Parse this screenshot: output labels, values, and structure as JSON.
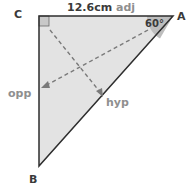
{
  "diagram": {
    "type": "right-triangle",
    "vertices": {
      "C": {
        "label": "C",
        "note": "right angle"
      },
      "A": {
        "label": "A"
      },
      "B": {
        "label": "B"
      }
    },
    "top_side": {
      "length": "12.6cm",
      "role": "adj"
    },
    "angle_A": "60°",
    "left_side_role": "opp",
    "hypotenuse_role": "hyp",
    "colors": {
      "fill": "#e3e3e3",
      "stroke": "#2e2e2e",
      "angle_wedge": "#bdbdbd",
      "right_angle_marker": "#c8c8c8",
      "dashed_arrows": "#7a7a7a",
      "role_label": "#8f8f8f"
    }
  }
}
